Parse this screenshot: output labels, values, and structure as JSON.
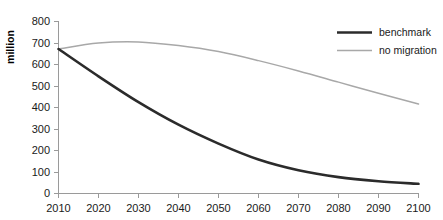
{
  "chart_data": {
    "type": "line",
    "title": "",
    "xlabel": "",
    "ylabel": "million",
    "xlim": [
      2010,
      2100
    ],
    "ylim": [
      0,
      800
    ],
    "ytick_step": 100,
    "xtick_step": 10,
    "grid": false,
    "legend_position": "top-right",
    "x": [
      2010,
      2020,
      2030,
      2040,
      2050,
      2060,
      2070,
      2080,
      2090,
      2100
    ],
    "xticklabels": [
      "2010",
      "2020",
      "2030",
      "2040",
      "2050",
      "2060",
      "2070",
      "2080",
      "2090",
      "2100"
    ],
    "yticklabels": [
      "0",
      "100",
      "200",
      "300",
      "400",
      "500",
      "600",
      "700",
      "800"
    ],
    "yticks": [
      0,
      100,
      200,
      300,
      400,
      500,
      600,
      700,
      800
    ],
    "series": [
      {
        "name": "benchmark",
        "color": "#2b2b2b",
        "line_width": 2.6,
        "values": [
          672,
          545,
          425,
          320,
          232,
          158,
          108,
          76,
          57,
          45
        ]
      },
      {
        "name": "no migration",
        "color": "#a8a8a8",
        "line_width": 1.5,
        "values": [
          672,
          700,
          705,
          688,
          660,
          618,
          570,
          518,
          466,
          416
        ]
      }
    ]
  },
  "legend": {
    "items": [
      {
        "label": "benchmark",
        "color": "#2b2b2b"
      },
      {
        "label": "no migration",
        "color": "#a8a8a8"
      }
    ]
  },
  "axis": {
    "y_title": "million",
    "axis_color": "#9a9a9a",
    "text_color": "#1a1a1a"
  }
}
